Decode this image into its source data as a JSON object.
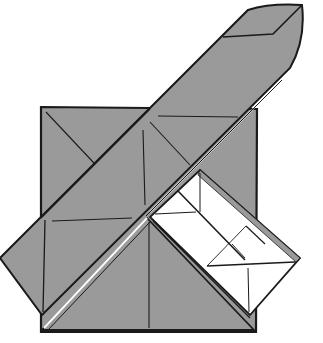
{
  "diagram": {
    "type": "origami-fold-step",
    "colors": {
      "paper_gray": "#9a9a9a",
      "paper_white": "#ffffff",
      "line": "#1a1a1a",
      "background": "#ffffff"
    },
    "parts": [
      {
        "name": "square-base",
        "color": "gray"
      },
      {
        "name": "diagonal-strip",
        "color": "gray"
      },
      {
        "name": "left-flap",
        "color": "gray"
      },
      {
        "name": "bottom-triangle",
        "color": "gray"
      },
      {
        "name": "white-pocket",
        "color": "white"
      }
    ]
  }
}
